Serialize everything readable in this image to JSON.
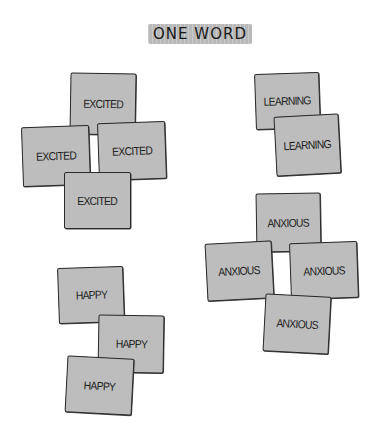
{
  "title": "ONE WORD",
  "notes": [
    {
      "group": "excited",
      "label": "EXCITED",
      "x": 70,
      "y": 73,
      "w": 66,
      "h": 62,
      "rot": 1
    },
    {
      "group": "excited",
      "label": "EXCITED",
      "x": 22,
      "y": 126,
      "w": 68,
      "h": 60,
      "rot": -2
    },
    {
      "group": "excited",
      "label": "EXCITED",
      "x": 98,
      "y": 122,
      "w": 68,
      "h": 58,
      "rot": -2
    },
    {
      "group": "excited",
      "label": "EXCITED",
      "x": 64,
      "y": 172,
      "w": 67,
      "h": 57,
      "rot": 0
    },
    {
      "group": "learning",
      "label": "LEARNING",
      "x": 255,
      "y": 73,
      "w": 65,
      "h": 56,
      "rot": -2
    },
    {
      "group": "learning",
      "label": "LEARNING",
      "x": 275,
      "y": 115,
      "w": 65,
      "h": 60,
      "rot": -3
    },
    {
      "group": "anxious",
      "label": "ANXIOUS",
      "x": 256,
      "y": 193,
      "w": 65,
      "h": 59,
      "rot": -1
    },
    {
      "group": "anxious",
      "label": "ANXIOUS",
      "x": 206,
      "y": 242,
      "w": 67,
      "h": 58,
      "rot": -3
    },
    {
      "group": "anxious",
      "label": "ANXIOUS",
      "x": 290,
      "y": 242,
      "w": 68,
      "h": 57,
      "rot": -2
    },
    {
      "group": "anxious",
      "label": "ANXIOUS",
      "x": 264,
      "y": 295,
      "w": 66,
      "h": 58,
      "rot": 3
    },
    {
      "group": "happy",
      "label": "HAPPY",
      "x": 58,
      "y": 267,
      "w": 66,
      "h": 56,
      "rot": -2
    },
    {
      "group": "happy",
      "label": "HAPPY",
      "x": 98,
      "y": 315,
      "w": 66,
      "h": 58,
      "rot": 1
    },
    {
      "group": "happy",
      "label": "HAPPY",
      "x": 66,
      "y": 357,
      "w": 67,
      "h": 57,
      "rot": 3
    }
  ],
  "colors": {
    "note_fill": "#bdbdbd",
    "note_border": "#2a2a2a",
    "title_highlight": "#b9b9b9"
  }
}
